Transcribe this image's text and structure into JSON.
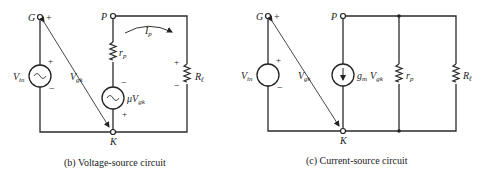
{
  "diagrams": [
    {
      "id": "b",
      "caption": "(b)  Voltage-source circuit",
      "nodes": {
        "grid": "G",
        "plate": "P",
        "cathode": "K"
      },
      "labels": {
        "vin": "V",
        "vin_sub": "in",
        "vgk": "V",
        "vgk_sub": "gk",
        "rp": "r",
        "rp_sub": "p",
        "source": "μV",
        "source_sub": "gk",
        "ip": "I",
        "ip_sub": "p",
        "rl": "R",
        "rl_sub": "ℓ"
      },
      "signs": {
        "plus": "+",
        "minus": "−"
      }
    },
    {
      "id": "c",
      "caption": "(c)  Current-source circuit",
      "nodes": {
        "grid": "G",
        "plate": "P",
        "cathode": "K"
      },
      "labels": {
        "vin": "V",
        "vin_sub": "in",
        "vgk": "V",
        "vgk_sub": "gk",
        "source_gm": "g",
        "source_gm_sub": "m",
        "source_v": "V",
        "source_v_sub": "gk",
        "rp": "r",
        "rp_sub": "p",
        "rl": "R",
        "rl_sub": "ℓ"
      },
      "signs": {
        "plus": "+",
        "minus": "−"
      }
    }
  ]
}
